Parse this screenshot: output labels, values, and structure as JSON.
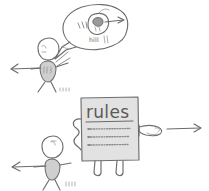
{
  "image": {
    "title": "Hand-drawn sketch: figure explaining while a rules sign points elsewhere",
    "style": "pencil sketch, grayscale",
    "background_color": "#ffffff",
    "ink_color": "#6b6b6b",
    "shade_color": "#cfcfcf",
    "board_color": "#e2e2e2",
    "width": 209,
    "height": 191
  },
  "speech_bubble": {
    "name": "speech-bubble",
    "contents_label": "hill",
    "inner_sketch": "small-figure-with-arrow",
    "inner_arrow_direction": "right",
    "tail_direction": "down-left"
  },
  "figures": [
    {
      "id": "upper-figure",
      "name": "stick-figure-speaking",
      "head": "profile-head",
      "torso": "shaded-oval-torso",
      "arrow_direction": "left",
      "has_speech_bubble": true
    },
    {
      "id": "lower-figure",
      "name": "stick-figure-listening",
      "head": "profile-head",
      "torso": "shaded-oval-torso",
      "arrow_direction": "left",
      "has_speech_bubble": false
    }
  ],
  "rules_board": {
    "name": "rules-sign",
    "title": "rules",
    "underlined": true,
    "body_lines": [
      "scribble-line-1",
      "scribble-line-2",
      "scribble-line-3"
    ],
    "has_legs": true,
    "left_arm": "squiggle-arm",
    "right_arm": "pointing-hand",
    "pointing_direction": "right"
  },
  "arrows": [
    {
      "name": "arrow-upper-left",
      "direction": "left"
    },
    {
      "name": "arrow-bubble-right",
      "direction": "right"
    },
    {
      "name": "arrow-board-right",
      "direction": "right"
    },
    {
      "name": "arrow-lower-left",
      "direction": "left"
    }
  ]
}
